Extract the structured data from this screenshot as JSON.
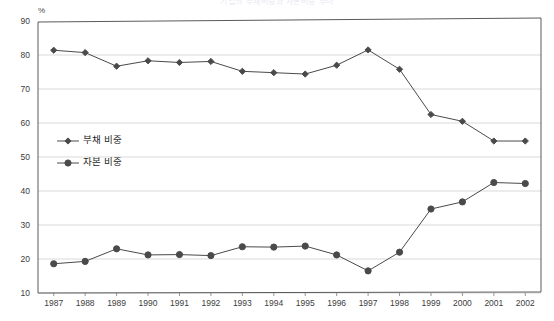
{
  "chart_data": {
    "type": "line",
    "title": "기업의 부채비중과 자본비중 추이",
    "unit_label": "%",
    "xlabel": "",
    "ylabel": "",
    "ylim": [
      10,
      90
    ],
    "ytick_step": 10,
    "grid": true,
    "legend_position": "inside-left",
    "categories": [
      "1987",
      "1988",
      "1989",
      "1990",
      "1991",
      "1992",
      "1993",
      "1994",
      "1995",
      "1996",
      "1997",
      "1998",
      "1999",
      "2000",
      "2001",
      "2002"
    ],
    "yticks": [
      "10",
      "20",
      "30",
      "40",
      "50",
      "60",
      "70",
      "80",
      "90"
    ],
    "series": [
      {
        "name": "부채 비중",
        "marker": "diamond",
        "color": "#4a4a4a",
        "values": [
          81.4,
          80.7,
          76.7,
          78.3,
          77.8,
          78.1,
          75.2,
          74.8,
          74.4,
          77.0,
          81.5,
          75.8,
          62.5,
          60.5,
          54.7,
          54.7
        ]
      },
      {
        "name": "자본 비중",
        "marker": "circle",
        "color": "#4a4a4a",
        "values": [
          18.6,
          19.3,
          23.0,
          21.2,
          21.3,
          21.0,
          23.6,
          23.5,
          23.8,
          21.2,
          16.5,
          22.0,
          34.7,
          36.8,
          42.5,
          42.2
        ]
      }
    ]
  }
}
